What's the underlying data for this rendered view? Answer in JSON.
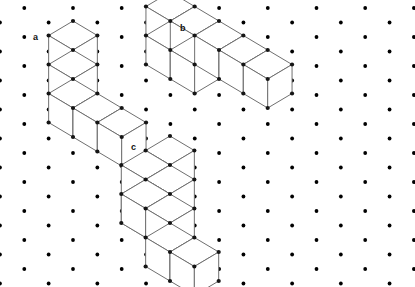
{
  "page": {
    "width": 415,
    "height": 287,
    "background_color": "#ffffff"
  },
  "grid": {
    "name": "isometric-dot-grid",
    "dot_color": "#000000",
    "dot_radius": 1.9,
    "x_step": 48.7,
    "y_step": 29.0,
    "origin_x": 24.3,
    "origin_y": 8.0,
    "columns": 9,
    "rows": 11,
    "description": "Two interleaved rectangular dot lattices offset by half a step forming an isometric triangular grid"
  },
  "style": {
    "edge_color": "#6f6f6f",
    "edge_width": 1.0,
    "vertex_color": "#151515",
    "vertex_radius": 2.1,
    "face_fill": "#ffffff"
  },
  "figures": [
    {
      "id": "a",
      "label": "a",
      "label_x": 33,
      "label_y": 40,
      "cube_count": 6,
      "description": "Stack of three cubes on the left column plus a row of three cubes extending to the right at the base level",
      "unit": {
        "hx": 24.35,
        "hy": 14.5,
        "vz": 29.0
      },
      "origin": {
        "x": 73.0,
        "y": 21.0
      },
      "cubes": [
        {
          "i": 0,
          "j": 0,
          "k": 2
        },
        {
          "i": 0,
          "j": 0,
          "k": 1
        },
        {
          "i": 0,
          "j": 0,
          "k": 0
        },
        {
          "i": 1,
          "j": 0,
          "k": 0
        },
        {
          "i": 2,
          "j": 0,
          "k": 0
        }
      ]
    },
    {
      "id": "b",
      "label": "b",
      "label_x": 180,
      "label_y": 31,
      "cube_count": 7,
      "description": "Two stacked cubes at the left, a descending zig-zag row of cubes stepping down to the right, ending in a pair of cubes",
      "unit": {
        "hx": 24.35,
        "hy": 14.5,
        "vz": 29.0
      },
      "origin": {
        "x": 219.0,
        "y": 21.0
      }
    },
    {
      "id": "c",
      "label": "c",
      "label_x": 131,
      "label_y": 150,
      "cube_count": 8,
      "description": "Pyramid-like staircase: one cube on top, a middle layer, a lower-left stack and a pair of cubes extending right at the base",
      "unit": {
        "hx": 24.35,
        "hy": 14.5,
        "vz": 29.0
      },
      "origin": {
        "x": 170.0,
        "y": 136.0
      }
    }
  ],
  "artifacts": {
    "smudge": {
      "name": "faint-pencil-mark",
      "x": 68,
      "y": 30,
      "width": 18,
      "height": 8,
      "color": "#cfcfcf"
    }
  }
}
